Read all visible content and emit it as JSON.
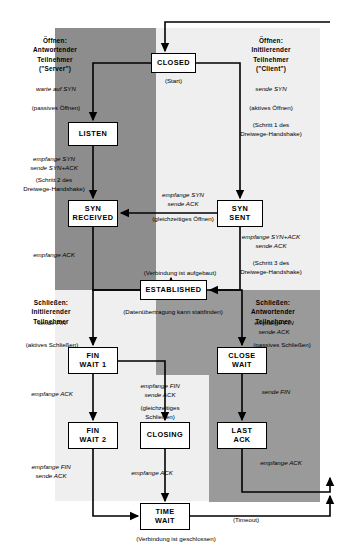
{
  "diagram": {
    "language": "de",
    "type": "state-machine"
  },
  "regions": {
    "open_server": {
      "label": "Öffnen:\nAntwortender\nTeilnehmer\n(\"Server\")",
      "color": "#8d8d8d"
    },
    "open_client": {
      "label": "Öffnen:\nInitiierender\nTeilnehmer\n(\"Client\")",
      "color": "#efefef"
    },
    "close_initiator": {
      "label": "Schließen:\nInitiierender\nTeilnehmer",
      "color": "#efefef"
    },
    "close_responder": {
      "label": "Schließen:\nAntwortender\nTeilnehmer",
      "color": "#9a9a9a"
    }
  },
  "states": {
    "closed": "CLOSED",
    "listen": "LISTEN",
    "syn_received": "SYN\nRECEIVED",
    "syn_sent": "SYN\nSENT",
    "established": "ESTABLISHED",
    "fin_wait_1": "FIN\nWAIT 1",
    "close_wait": "CLOSE\nWAIT",
    "fin_wait_2": "FIN\nWAIT 2",
    "closing": "CLOSING",
    "last_ack": "LAST\nACK",
    "time_wait": "TIME\nWAIT"
  },
  "transitions": {
    "start": "(Start)",
    "warte_auf_syn": "warte auf SYN",
    "passives_oeffnen": "(passives Öffnen)",
    "empfange_syn_sende_synack": "empfange SYN\nsende SYN+ACK",
    "schritt2": "(Schritt 2 des\nDreiwege-Handshake)",
    "empfange_ack_left": "empfange ACK",
    "sende_syn": "sende SYN",
    "aktives_oeffnen": "(aktives Öffnen)",
    "schritt1": "(Schritt 1 des\nDreiwege-Handshake)",
    "empfange_syn_sende_ack": "empfange SYN\nsende ACK",
    "gleichzeitiges_oeffnen": "(gleichzeitiges Öffnen)",
    "empfange_synack_sende_ack": "empfange SYN+ACK\nsende ACK",
    "schritt3": "(Schritt 3 des\nDreiwege-Handshake)",
    "verbindung_aufgebaut": "(Verbindung ist aufgebaut)",
    "datenuebertragung": "(Datenübertragung kann stattfinden)",
    "sende_fin": "sende FIN",
    "aktives_schliessen": "(aktives Schließen)",
    "empfange_ack_2": "empfange ACK",
    "empfange_fin_sende_ack": "empfange FIN\nsende ACK",
    "gleichzeitiges_schliessen": "(gleichzeitiges\nSchließen)",
    "empfange_fin_sende_ack_2": "empfange FIN\nsende ACK",
    "empfange_ack_3": "empfange ACK",
    "empfange_fin_sende_ack_resp": "empfange FIN\nsende ACK",
    "passives_schliessen": "(passives Schließen)",
    "sende_fin_resp": "sende FIN",
    "empfange_ack_resp": "empfange ACK",
    "timeout": "(Timeout)",
    "verbindung_geschlossen": "(Verbindung ist geschlossen)"
  }
}
